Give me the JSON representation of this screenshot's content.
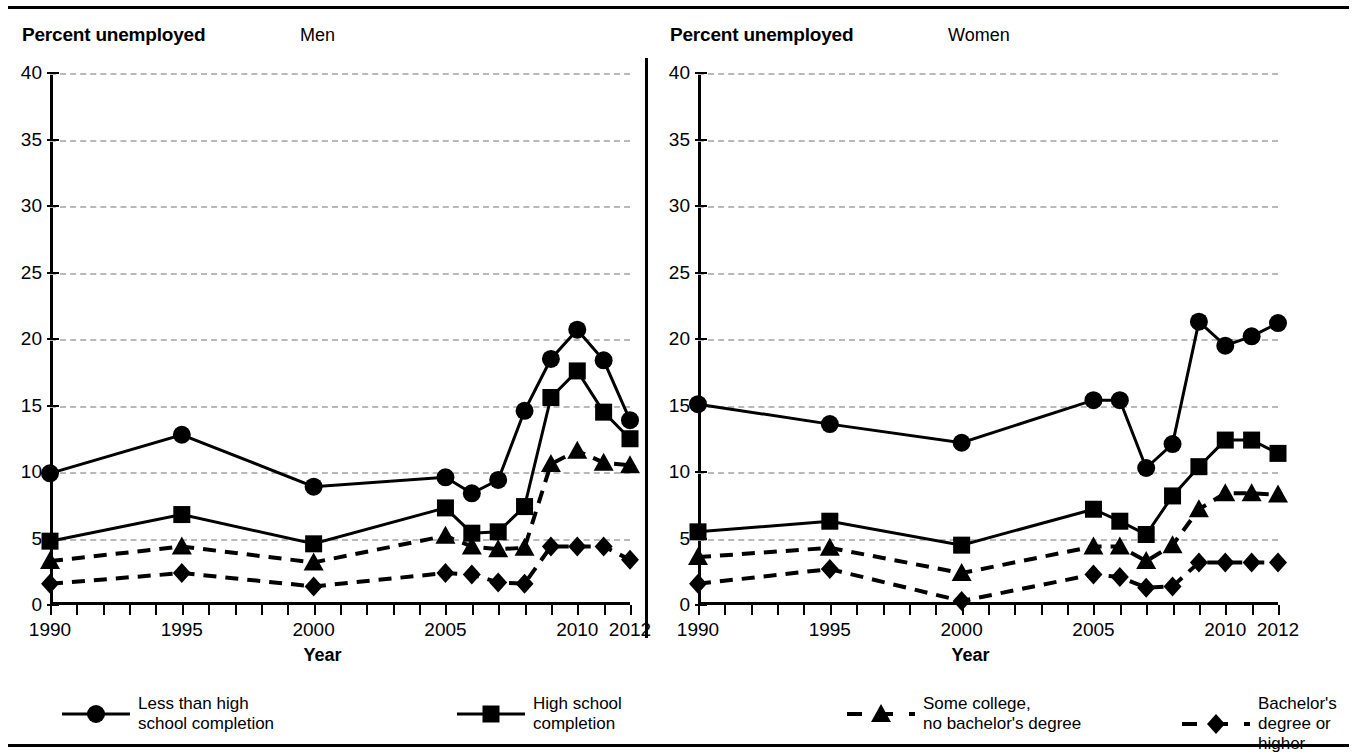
{
  "figure": {
    "y_axis_title": "Percent unemployed",
    "x_axis_title": "Year"
  },
  "panels": [
    {
      "id": "men",
      "label": "Men"
    },
    {
      "id": "women",
      "label": "Women"
    }
  ],
  "axes": {
    "y_ticks": [
      "0",
      "5",
      "10",
      "15",
      "20",
      "25",
      "30",
      "35",
      "40"
    ],
    "x_ticks": [
      "1990",
      "1995",
      "2000",
      "2005",
      "2010",
      "2012"
    ]
  },
  "legend": [
    {
      "key": "less-than-high-school",
      "label": "Less than high\nschool completion",
      "marker": "circle",
      "line": "solid"
    },
    {
      "key": "high-school",
      "label": "High school\ncompletion",
      "marker": "square",
      "line": "solid"
    },
    {
      "key": "some-college",
      "label": "Some college,\nno bachelor's degree",
      "marker": "triangle",
      "line": "dashed"
    },
    {
      "key": "bachelors",
      "label": "Bachelor's degree or higher",
      "marker": "diamond",
      "line": "dashed"
    }
  ],
  "chart_data": [
    {
      "type": "line",
      "title": "Men",
      "xlabel": "Year",
      "ylabel": "Percent unemployed",
      "xlim": [
        1990,
        2012
      ],
      "ylim": [
        0,
        40
      ],
      "yticks": [
        0,
        5,
        10,
        15,
        20,
        25,
        30,
        35,
        40
      ],
      "grid": true,
      "legend_position": "bottom",
      "x": [
        1990,
        1995,
        2000,
        2005,
        2006,
        2007,
        2008,
        2009,
        2010,
        2011,
        2012
      ],
      "series": [
        {
          "name": "Less than high school completion",
          "marker": "circle",
          "line": "solid",
          "values": [
            9.9,
            12.8,
            8.9,
            9.6,
            8.4,
            9.4,
            14.6,
            18.5,
            20.7,
            18.4,
            13.9
          ]
        },
        {
          "name": "High school completion",
          "marker": "square",
          "line": "solid",
          "values": [
            4.8,
            6.8,
            4.6,
            7.3,
            5.4,
            5.5,
            7.4,
            15.6,
            17.6,
            14.5,
            12.5
          ]
        },
        {
          "name": "Some college, no bachelor's degree",
          "marker": "triangle",
          "line": "dashed",
          "values": [
            3.3,
            4.4,
            3.2,
            5.2,
            4.4,
            4.2,
            4.3,
            10.6,
            11.6,
            10.7,
            10.5
          ]
        },
        {
          "name": "Bachelor's degree or higher",
          "marker": "diamond",
          "line": "dashed",
          "values": [
            1.6,
            2.4,
            1.4,
            2.4,
            2.3,
            1.7,
            1.6,
            4.4,
            4.4,
            4.4,
            3.4
          ]
        }
      ]
    },
    {
      "type": "line",
      "title": "Women",
      "xlabel": "Year",
      "ylabel": "Percent unemployed",
      "xlim": [
        1990,
        2012
      ],
      "ylim": [
        0,
        40
      ],
      "yticks": [
        0,
        5,
        10,
        15,
        20,
        25,
        30,
        35,
        40
      ],
      "grid": true,
      "legend_position": "bottom",
      "x": [
        1990,
        1995,
        2000,
        2005,
        2006,
        2007,
        2008,
        2009,
        2010,
        2011,
        2012
      ],
      "series": [
        {
          "name": "Less than high school completion",
          "marker": "circle",
          "line": "solid",
          "values": [
            15.1,
            13.6,
            12.2,
            15.4,
            15.4,
            10.3,
            12.1,
            21.3,
            19.5,
            20.2,
            21.2
          ]
        },
        {
          "name": "High school completion",
          "marker": "square",
          "line": "solid",
          "values": [
            5.5,
            6.3,
            4.5,
            7.2,
            6.3,
            5.3,
            8.2,
            10.4,
            12.4,
            12.4,
            11.4
          ]
        },
        {
          "name": "Some college, no bachelor's degree",
          "marker": "triangle",
          "line": "dashed",
          "values": [
            3.6,
            4.3,
            2.4,
            4.4,
            4.4,
            3.3,
            4.5,
            7.2,
            8.4,
            8.4,
            8.3
          ]
        },
        {
          "name": "Bachelor's degree or higher",
          "marker": "diamond",
          "line": "dashed",
          "values": [
            1.6,
            2.7,
            0.3,
            2.3,
            2.1,
            1.3,
            1.4,
            3.2,
            3.2,
            3.2,
            3.2
          ]
        }
      ]
    }
  ]
}
